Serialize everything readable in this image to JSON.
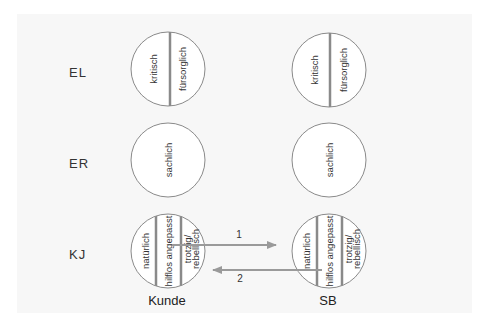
{
  "diagram": {
    "type": "transactional-analysis",
    "colors": {
      "panel": "#f7f7f7",
      "stroke": "#8a8a8a",
      "arrow": "#9a9a9a",
      "circle_fill": "#ffffff"
    },
    "row_labels": [
      "EL",
      "ER",
      "KJ"
    ],
    "columns": [
      {
        "label": "Kunde"
      },
      {
        "label": "SB"
      }
    ],
    "states": {
      "el": [
        "kritisch",
        "fürsorglich"
      ],
      "er": [
        "sachlich"
      ],
      "kj": [
        "natürlich",
        "hilflos angepasst",
        "trotzig/",
        "rebellisch"
      ]
    },
    "arrows": [
      {
        "label": "1",
        "from": "Kunde KJ (hilflos angepasst)",
        "to": "SB KJ"
      },
      {
        "label": "2",
        "from": "SB KJ (hilflos angepasst)",
        "to": "Kunde KJ"
      }
    ]
  }
}
